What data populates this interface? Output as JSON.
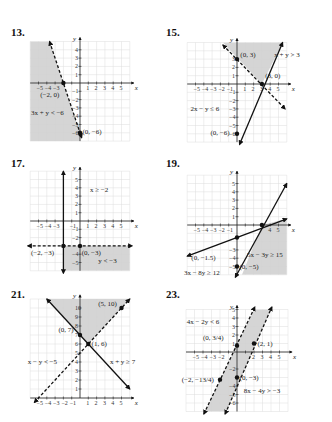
{
  "page": {
    "background": "#ffffff",
    "grid_color": "#dcdcdc",
    "shade_color": "#d0d0d0",
    "line_color": "#111111"
  },
  "problems": [
    {
      "number": "13.",
      "num_pos": [
        11,
        28
      ],
      "origin": [
        80,
        83
      ],
      "unit_x": 8.3,
      "unit_y": 8.3,
      "xrange": [
        -6,
        6.5
      ],
      "yrange": [
        -7,
        5
      ],
      "grid": [
        -6,
        6,
        -7,
        5
      ],
      "x_ticks": [
        "-5",
        "-4",
        "-3",
        "",
        "",
        "1",
        "2",
        "3",
        "4",
        "5"
      ],
      "x_tick_vals": [
        -5,
        -4,
        -3,
        -2,
        -1,
        1,
        2,
        3,
        4,
        5
      ],
      "y_ticks_vals": [
        4,
        3,
        2,
        1,
        -1,
        -2,
        -3,
        -4,
        -5,
        -6
      ],
      "shade": [
        [
          -6,
          5
        ],
        [
          -3.67,
          5
        ],
        [
          -0.33,
          -5
        ],
        [
          0,
          -6
        ],
        [
          0,
          -7
        ],
        [
          -6,
          -7
        ]
      ],
      "lines": [
        {
          "from": [
            -3.67,
            5
          ],
          "to": [
            0.2,
            -6.6
          ],
          "dashed": true
        }
      ],
      "points": [
        [
          -2,
          0
        ],
        [
          0,
          -6
        ]
      ],
      "labels": [
        {
          "text": "(−2, 0)",
          "at": [
            -4.8,
            -1.7
          ]
        },
        {
          "text": "3x + y < −6",
          "at": [
            -5.9,
            -3.9
          ]
        },
        {
          "text": "(0, −6)",
          "at": [
            0.3,
            -6.2
          ]
        }
      ]
    },
    {
      "number": "15.",
      "num_pos": [
        166,
        28
      ],
      "origin": [
        237,
        84
      ],
      "unit_x": 8.3,
      "unit_y": 8.3,
      "grid": [
        -6,
        6,
        -7,
        5
      ],
      "x_ticks": [
        "-5",
        "-4",
        "-3",
        "-2",
        "-1",
        "1",
        "2",
        "3",
        "4",
        "5"
      ],
      "x_tick_vals": [
        -5,
        -4,
        -3,
        -2,
        -1,
        1,
        2,
        3,
        4,
        5
      ],
      "y_ticks_vals": [
        3,
        2,
        1,
        -1,
        -2,
        -3,
        -4,
        -5,
        -6
      ],
      "shade": [
        [
          -1.7,
          5
        ],
        [
          5.5,
          5
        ],
        [
          3,
          0
        ]
      ],
      "lines": [
        {
          "from": [
            -1.7,
            4.7
          ],
          "to": [
            5.8,
            -3
          ],
          "dashed": true
        },
        {
          "from": [
            0.3,
            -7.3
          ],
          "to": [
            5.5,
            5
          ],
          "dashed": false
        }
      ],
      "points": [
        [
          0,
          3
        ],
        [
          3,
          0
        ],
        [
          0,
          -6
        ]
      ],
      "labels": [
        {
          "text": "(0, 3)",
          "at": [
            0.4,
            3.3
          ]
        },
        {
          "text": "x + y > 3",
          "at": [
            4.5,
            3.3
          ]
        },
        {
          "text": "(3, 0)",
          "at": [
            3.4,
            0.7
          ]
        },
        {
          "text": "2x − y ≤ 6",
          "at": [
            -5.6,
            -3.3
          ]
        },
        {
          "text": "(0, −6)",
          "at": [
            -3.2,
            -6.2
          ]
        }
      ]
    },
    {
      "number": "17.",
      "num_pos": [
        11,
        159
      ],
      "origin": [
        80,
        221
      ],
      "unit_x": 8.3,
      "unit_y": 8.3,
      "grid": [
        -6,
        6,
        -6,
        6
      ],
      "x_ticks": [
        "-5",
        "-4",
        "-3",
        "",
        "-1",
        "1",
        "2",
        "3",
        "4",
        "5"
      ],
      "x_tick_vals": [
        -5,
        -4,
        -3,
        -2,
        -1,
        1,
        2,
        3,
        4,
        5
      ],
      "y_ticks_vals": [
        5,
        4,
        3,
        2,
        1,
        -1,
        -2,
        -4,
        -5
      ],
      "shade": [
        [
          -2,
          -3
        ],
        [
          6,
          -3
        ],
        [
          6,
          -6
        ],
        [
          -2,
          -6
        ]
      ],
      "lines": [
        {
          "from": [
            -2,
            6
          ],
          "to": [
            -2,
            -6.3
          ],
          "dashed": false,
          "arrows": true
        },
        {
          "from": [
            -6.3,
            -3
          ],
          "to": [
            6.3,
            -3
          ],
          "dashed": true,
          "arrows": true
        }
      ],
      "points": [
        [
          -2,
          -3
        ],
        [
          0,
          -3
        ]
      ],
      "labels": [
        {
          "text": "x ≥ −2",
          "at": [
            1.2,
            3.5
          ]
        },
        {
          "text": "(−2, −3)",
          "at": [
            -5.9,
            -4.1
          ]
        },
        {
          "text": "(0, −3)",
          "at": [
            0.2,
            -4.1
          ]
        },
        {
          "text": "y < −3",
          "at": [
            2.2,
            -5.0
          ]
        }
      ]
    },
    {
      "number": "19.",
      "num_pos": [
        166,
        159
      ],
      "origin": [
        237,
        225
      ],
      "unit_x": 8.3,
      "unit_y": 8.3,
      "grid": [
        -6,
        6,
        -6,
        6
      ],
      "x_ticks": [
        "-5",
        "-4",
        "-3",
        "-2",
        "-1",
        "",
        "",
        "",
        "4",
        "5"
      ],
      "x_tick_vals": [
        -5,
        -4,
        -3,
        -2,
        -1,
        1,
        2,
        3,
        4,
        5
      ],
      "y_ticks_vals": [
        5,
        4,
        3,
        2,
        1,
        -3,
        -4,
        -5
      ],
      "shade": [
        [
          3,
          0
        ],
        [
          6,
          0.75
        ],
        [
          6,
          -6
        ],
        [
          0.6,
          -6
        ]
      ],
      "lines": [
        {
          "from": [
            -6,
            -3.75
          ],
          "to": [
            6,
            0.75
          ],
          "dashed": false,
          "arrows": true
        },
        {
          "from": [
            -0.2,
            -6.3
          ],
          "to": [
            6,
            5
          ],
          "dashed": false,
          "arrows": true
        }
      ],
      "points": [
        [
          0,
          -1.5
        ],
        [
          3,
          0
        ],
        [
          0,
          -5
        ]
      ],
      "labels": [
        {
          "text": "(0, −1.5)",
          "at": [
            -5.5,
            -4.2
          ]
        },
        {
          "text": "5x − 3y ≥ 15",
          "at": [
            1.2,
            -3.9
          ]
        },
        {
          "text": "(0, −5)",
          "at": [
            0.3,
            -5.3
          ]
        },
        {
          "text": "3x − 8y ≥ 12",
          "at": [
            -6.4,
            -6.0
          ]
        }
      ]
    },
    {
      "number": "21.",
      "num_pos": [
        11,
        290
      ],
      "origin": [
        80,
        398
      ],
      "unit_x": 8.3,
      "unit_y": 9.0,
      "grid": [
        -6,
        6,
        0,
        11
      ],
      "x_ticks": [
        "-5",
        "-4",
        "-3",
        "-2",
        "-1",
        "1",
        "2",
        "3",
        "4",
        "5"
      ],
      "x_tick_vals": [
        -5,
        -4,
        -3,
        -2,
        -1,
        1,
        2,
        3,
        4,
        5
      ],
      "y_ticks_vals": [
        10,
        9,
        8,
        7,
        6,
        5,
        4,
        3,
        2,
        1
      ],
      "shade": [
        [
          -4,
          11
        ],
        [
          6,
          11
        ],
        [
          1,
          6
        ]
      ],
      "lines": [
        {
          "from": [
            -4,
            11
          ],
          "to": [
            6,
            1
          ],
          "dashed": false,
          "arrows": true
        },
        {
          "from": [
            -5.5,
            -0.5
          ],
          "to": [
            6,
            11
          ],
          "dashed": true,
          "arrows": true
        }
      ],
      "points": [
        [
          0,
          7
        ],
        [
          1,
          6
        ],
        [
          5,
          10
        ]
      ],
      "labels": [
        {
          "text": "(0, 7)",
          "at": [
            -2.6,
            7.3
          ]
        },
        {
          "text": "(1, 6)",
          "at": [
            1.4,
            5.8
          ]
        },
        {
          "text": "(5, 10)",
          "at": [
            2.2,
            10.2
          ]
        },
        {
          "text": "x − y < −5",
          "at": [
            -6.3,
            3.8
          ]
        },
        {
          "text": "x + y ≥ 7",
          "at": [
            3.6,
            3.8
          ]
        }
      ]
    },
    {
      "number": "23.",
      "num_pos": [
        166,
        290
      ],
      "origin": [
        237,
        352
      ],
      "unit_x": 8.5,
      "unit_y": 8.5,
      "grid": [
        -6,
        6,
        -7,
        5
      ],
      "x_ticks": [
        "-5",
        "-4",
        "-3",
        "-2",
        "",
        "",
        "2",
        "3",
        "4",
        "5"
      ],
      "x_tick_vals": [
        -5,
        -4,
        -3,
        -2,
        -1,
        1,
        2,
        3,
        4,
        5
      ],
      "y_ticks_vals": [
        5,
        4,
        3,
        2,
        1,
        -2,
        -4,
        -5,
        -6
      ],
      "shade": [
        [
          2,
          5
        ],
        [
          4,
          5
        ],
        [
          -1.25,
          -7
        ],
        [
          -3.75,
          -7
        ]
      ],
      "lines": [
        {
          "from": [
            -3.9,
            -7.3
          ],
          "to": [
            2.1,
            5.3
          ],
          "dashed": true,
          "arrows": true
        },
        {
          "from": [
            -1.4,
            -7.3
          ],
          "to": [
            4.1,
            5.3
          ],
          "dashed": true,
          "arrows": true
        }
      ],
      "points": [
        [
          0,
          0.75
        ],
        [
          2,
          1
        ],
        [
          -2,
          -3.25
        ],
        [
          0,
          -3
        ]
      ],
      "labels": [
        {
          "text": "4x − 2y < 6",
          "at": [
            -5.9,
            3.3
          ]
        },
        {
          "text": "(0, 3/4)",
          "at": [
            -4.0,
            1.4
          ]
        },
        {
          "text": "(2, 1)",
          "at": [
            2.4,
            0.7
          ]
        },
        {
          "text": "(−2, −13/4)",
          "at": [
            -6.5,
            -3.5
          ]
        },
        {
          "text": "(0, −3)",
          "at": [
            0.3,
            -3.3
          ]
        },
        {
          "text": "8x − 4y > −3",
          "at": [
            0.8,
            -4.8
          ]
        }
      ]
    }
  ]
}
